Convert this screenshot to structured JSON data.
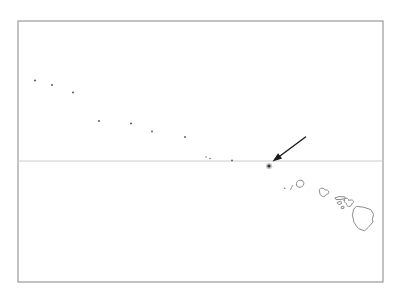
{
  "map": {
    "canvas": {
      "width": 398,
      "height": 296,
      "background": "#ffffff"
    },
    "colors": {
      "frame": "#9a9a9a",
      "latitude_line": "#cccccc",
      "dot": "#666666",
      "island_outline": "#8c8c8c",
      "arrow": "#1a1a1a",
      "highlight_halo": "#999999",
      "highlight_core": "#333333"
    },
    "frame": {
      "x": 18,
      "y": 21,
      "width": 365,
      "height": 261,
      "stroke_width": 1.2
    },
    "latitude_line": {
      "x1": 18,
      "y1": 161,
      "x2": 383,
      "y2": 161,
      "stroke_width": 1
    },
    "seamount_dots": [
      {
        "x": 35,
        "y": 80.5,
        "r": 1.1
      },
      {
        "x": 52,
        "y": 85,
        "r": 1.1
      },
      {
        "x": 73,
        "y": 92.5,
        "r": 1.1
      },
      {
        "x": 99,
        "y": 121,
        "r": 1.1
      },
      {
        "x": 131,
        "y": 123.5,
        "r": 1.1
      },
      {
        "x": 152,
        "y": 131.5,
        "r": 1.0
      },
      {
        "x": 185,
        "y": 137,
        "r": 1.0
      },
      {
        "x": 206,
        "y": 157,
        "r": 0.7
      },
      {
        "x": 210,
        "y": 158.5,
        "r": 0.8
      },
      {
        "x": 232,
        "y": 160.5,
        "r": 1.0
      },
      {
        "x": 284.8,
        "y": 188.3,
        "r": 0.7
      }
    ],
    "highlight_marker": {
      "x": 269,
      "y": 166,
      "halo_r": 3.1,
      "halo_opacity": 0.55,
      "core_r": 1.6
    },
    "arrow": {
      "shaft": {
        "x1": 305.5,
        "y1": 137,
        "x2": 280,
        "y2": 156
      },
      "shaft_width": 1.4,
      "head_points": "272.5,161.5 278.1,153.2 282.1,158.6"
    },
    "islands": [
      {
        "id": "niihau",
        "d": "M 290.5 189.5 C 291 188 292 186.5 292.8 185.5"
      },
      {
        "id": "kauai",
        "d": "M 296.5 185 C 295.8 182.2 297.5 180.3 300.2 180.2 C 302.8 180.1 304.2 181.8 303.8 184 C 303.4 186.2 301.2 187.6 298.9 187.2 C 297.4 186.9 296.8 186.1 296.5 185 Z"
      },
      {
        "id": "oahu",
        "d": "M 319.5 191.5 C 318.6 189.6 319.8 188.2 321.8 188.2 C 323.6 188.2 324.6 189 325.2 190 C 327 189.6 328.8 190.6 328.8 192.2 C 328.8 193.8 327.4 194.4 326.2 194.4 C 325.8 195.8 324.4 196.8 322.6 196.4 C 320.6 196 319.8 194.2 319.5 191.5 Z"
      },
      {
        "id": "molokai",
        "d": "M 335.2 197.8 L 339 196.6 L 344.6 196.8 L 345.4 198.6 L 341 199.4 L 336.4 199.6 Z"
      },
      {
        "id": "lanai",
        "d": "M 337.6 202.2 L 340.8 201.2 L 341.8 203.4 L 339 204.6 L 337.6 203.6 Z"
      },
      {
        "id": "maui",
        "d": "M 344.2 200.6 C 344 198.6 345.8 197.6 347.4 198.4 C 348.4 198.9 348.8 199.8 348.6 200.6 C 350 199.8 352.4 199.6 353.2 200.8 C 354 202 353.2 203.4 351.8 203.8 C 351.8 205.4 350.6 206.6 348.8 206.4 C 347.2 206.2 346.4 205 346.6 203.6 C 345.2 203.2 344.4 202 344.2 200.6 Z"
      },
      {
        "id": "kahoolawe",
        "d": "M 341.4 206.8 L 343.8 206.2 L 344 208.2 L 341.8 208.6 Z"
      },
      {
        "id": "hawaii",
        "d": "M 356.8 206.4 L 363.6 207.2 L 370.8 209.6 L 373.6 214.4 L 372.4 219.2 L 373 222 L 368.2 227.4 L 364.6 230.8 L 358.4 228.6 L 354 222.4 L 352.4 214.8 L 353.6 209.6 Z"
      }
    ]
  }
}
